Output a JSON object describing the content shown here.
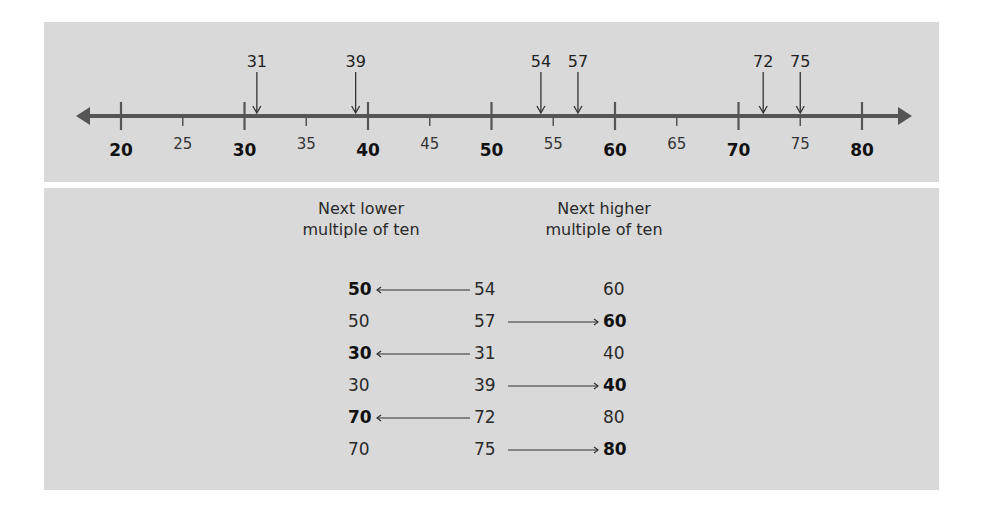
{
  "number_line": {
    "min": 20,
    "max": 80,
    "major_ticks": [
      {
        "value": 20,
        "label": "20"
      },
      {
        "value": 30,
        "label": "30"
      },
      {
        "value": 40,
        "label": "40"
      },
      {
        "value": 50,
        "label": "50"
      },
      {
        "value": 60,
        "label": "60"
      },
      {
        "value": 70,
        "label": "70"
      },
      {
        "value": 80,
        "label": "80"
      }
    ],
    "minor_ticks": [
      {
        "value": 25,
        "label": "25"
      },
      {
        "value": 35,
        "label": "35"
      },
      {
        "value": 45,
        "label": "45"
      },
      {
        "value": 55,
        "label": "55"
      },
      {
        "value": 65,
        "label": "65"
      },
      {
        "value": 75,
        "label": "75"
      }
    ],
    "marked_points": [
      {
        "value": 31,
        "label": "31"
      },
      {
        "value": 39,
        "label": "39"
      },
      {
        "value": 54,
        "label": "54"
      },
      {
        "value": 57,
        "label": "57"
      },
      {
        "value": 72,
        "label": "72"
      },
      {
        "value": 75,
        "label": "75"
      }
    ]
  },
  "table": {
    "header_lower_line1": "Next lower",
    "header_lower_line2": "multiple of ten",
    "header_higher_line1": "Next higher",
    "header_higher_line2": "multiple of ten",
    "rows": [
      {
        "lower": "50",
        "number": "54",
        "higher": "60",
        "rounds_to": "lower"
      },
      {
        "lower": "50",
        "number": "57",
        "higher": "60",
        "rounds_to": "higher"
      },
      {
        "lower": "30",
        "number": "31",
        "higher": "40",
        "rounds_to": "lower"
      },
      {
        "lower": "30",
        "number": "39",
        "higher": "40",
        "rounds_to": "higher"
      },
      {
        "lower": "70",
        "number": "72",
        "higher": "80",
        "rounds_to": "lower"
      },
      {
        "lower": "70",
        "number": "75",
        "higher": "80",
        "rounds_to": "higher"
      }
    ]
  },
  "colors": {
    "panel_bg": "#d9d9d9",
    "line": "#555555",
    "text": "#222222"
  }
}
